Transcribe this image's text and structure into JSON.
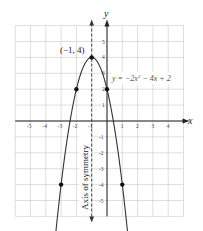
{
  "chart_data": {
    "type": "line",
    "title": "",
    "xlabel": "x",
    "ylabel": "y",
    "xlim": [
      -6,
      5
    ],
    "ylim": [
      -6,
      6
    ],
    "grid": true,
    "x_ticks": [
      -5,
      -4,
      -3,
      -2,
      -1,
      1,
      2,
      3,
      4
    ],
    "y_ticks": [
      -5,
      -4,
      -3,
      -2,
      -1,
      1,
      2,
      3,
      4,
      5
    ],
    "series": [
      {
        "name": "y = -2x² - 4x + 2",
        "function": "-2*x^2 - 4*x + 2",
        "x_range": [
          -3.35,
          1.35
        ]
      }
    ],
    "points": [
      {
        "x": -3,
        "y": -4
      },
      {
        "x": -2,
        "y": 2
      },
      {
        "x": -1,
        "y": 4
      },
      {
        "x": 0,
        "y": 2
      },
      {
        "x": 1,
        "y": -4
      }
    ],
    "axis_of_symmetry": {
      "x": -1,
      "label": "Axis of symmetry"
    },
    "annotations": [
      {
        "text": "(−1, 4)",
        "x": -1,
        "y": 4,
        "role": "vertex"
      },
      {
        "text": "y = −2x² − 4x + 2",
        "role": "equation"
      }
    ]
  },
  "labels": {
    "x_axis": "x",
    "y_axis": "y",
    "vertex": "(−1, 4)",
    "equation_prefix": "y = −2x",
    "equation_sup": "2",
    "equation_suffix": " − 4x + 2",
    "symmetry": "Axis of symmetry"
  }
}
